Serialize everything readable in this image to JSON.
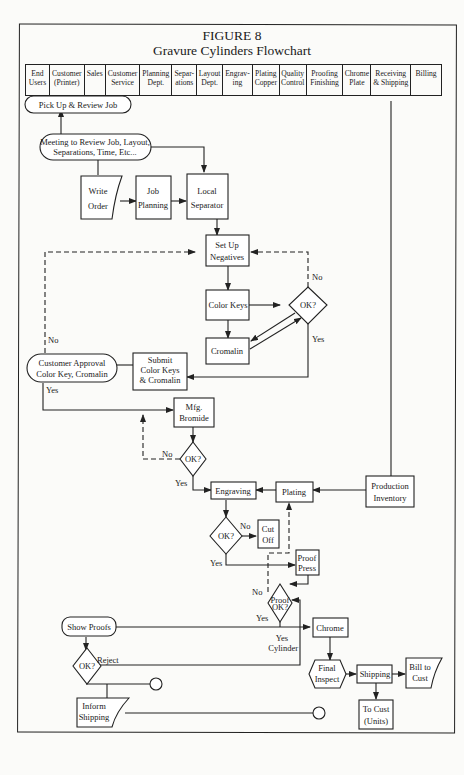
{
  "title": {
    "line1": "FIGURE 8",
    "line2": "Gravure Cylinders Flowchart"
  },
  "header_columns": [
    {
      "label": "End\nUsers"
    },
    {
      "label": "Customer\n(Printer)"
    },
    {
      "label": "Sales"
    },
    {
      "label": "Customer\nService"
    },
    {
      "label": "Planning\nDept."
    },
    {
      "label": "Separ-\nations"
    },
    {
      "label": "Layout\nDept."
    },
    {
      "label": "Engrav-\ning"
    },
    {
      "label": "Plating\nCopper"
    },
    {
      "label": "Quality\nControl"
    },
    {
      "label": "Proofing\nFinishing"
    },
    {
      "label": "Chrome\nPlate"
    },
    {
      "label": "Receiving\n& Shipping"
    },
    {
      "label": "Billing"
    }
  ],
  "nodes": {
    "pick_up": {
      "l1": "Pick Up & Review Job"
    },
    "meeting": {
      "l1": "Meeting to Review Job, Layout,",
      "l2": "Separations, Time, Etc..."
    },
    "write_order": {
      "l1": "Write",
      "l2": "Order"
    },
    "job_planning": {
      "l1": "Job",
      "l2": "Planning"
    },
    "local_separator": {
      "l1": "Local",
      "l2": "Separator"
    },
    "set_up_negatives": {
      "l1": "Set Up",
      "l2": "Negatives"
    },
    "color_keys": {
      "l1": "Color Keys"
    },
    "ok1": {
      "l1": "OK?"
    },
    "cromalin": {
      "l1": "Cromalin"
    },
    "customer_approval": {
      "l1": "Customer Approval",
      "l2": "Color Key, Cromalin"
    },
    "submit": {
      "l1": "Submit",
      "l2": "Color Keys",
      "l3": "& Cromalin"
    },
    "mfg_bromide": {
      "l1": "Mfg.",
      "l2": "Bromide"
    },
    "ok2": {
      "l1": "OK?"
    },
    "engraving": {
      "l1": "Engraving"
    },
    "plating": {
      "l1": "Plating"
    },
    "production_inventory": {
      "l1": "Production",
      "l2": "Inventory"
    },
    "ok3": {
      "l1": "OK?"
    },
    "cut_off": {
      "l1": "Cut",
      "l2": "Off"
    },
    "proof_press": {
      "l1": "Proof",
      "l2": "Press"
    },
    "proof_ok": {
      "l1": "Proof",
      "l2": "OK?"
    },
    "show_proofs": {
      "l1": "Show Proofs"
    },
    "chrome": {
      "l1": "Chrome"
    },
    "ok4": {
      "l1": "OK?"
    },
    "final_inspect": {
      "l1": "Final",
      "l2": "Inspect"
    },
    "shipping": {
      "l1": "Shipping"
    },
    "bill_to_cust": {
      "l1": "Bill to",
      "l2": "Cust"
    },
    "to_cust": {
      "l1": "To Cust",
      "l2": "(Units)"
    },
    "inform_shipping": {
      "l1": "Inform",
      "l2": "Shipping"
    }
  },
  "edge_labels": {
    "no_ok1": "No",
    "yes_ok1": "Yes",
    "no_customer": "No",
    "yes_customer": "Yes",
    "no_ok2": "No",
    "yes_ok2": "Yes",
    "no_ok3": "No",
    "yes_ok3": "Yes",
    "no_proof": "No",
    "yes_proof": "Yes",
    "yes_cylinder_1": "Yes",
    "yes_cylinder_2": "Cylinder",
    "reject": "Reject"
  }
}
